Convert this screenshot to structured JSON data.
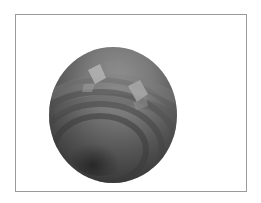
{
  "figure": {
    "frame": {
      "left": 15,
      "top": 14,
      "width": 232,
      "height": 178,
      "border_color": "#9a9a9a"
    },
    "sphere": {
      "center_x": 113,
      "center_y": 115,
      "radius_x": 64,
      "radius_y": 68,
      "colors": {
        "highlight": "#b4b4b4",
        "light": "#8e8e8e",
        "mid": "#6a6a6a",
        "dark": "#4a4a4a",
        "darkest": "#2e2e2e"
      },
      "highlight_facets": [
        {
          "points": "88,70 100,64 106,78 95,84"
        },
        {
          "points": "128,86 140,80 148,94 137,102"
        }
      ]
    }
  }
}
